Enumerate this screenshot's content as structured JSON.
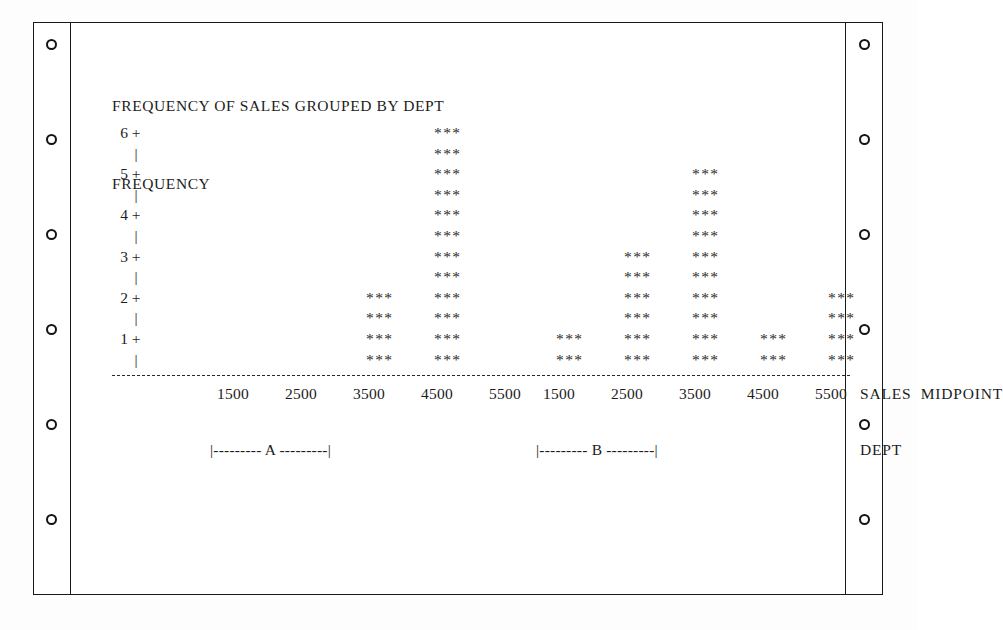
{
  "paper": {
    "type": "continuous-form-tractor-feed",
    "hole_count_per_side": 6
  },
  "report": {
    "title": "FREQUENCY OF SALES GROUPED BY DEPT",
    "subtitle": "FREQUENCY",
    "axis_caption": "SALES  MIDPOINT",
    "dept_caption": "DEPT",
    "bracket_a": "|--------- A ---------|",
    "bracket_b": "|--------- B ---------|",
    "y_ticks": [
      "6",
      "5",
      "4",
      "3",
      "2",
      "1"
    ],
    "tick_mark": "+",
    "stem_mark": "|",
    "star_glyph": "***"
  },
  "chart_data": {
    "type": "bar",
    "title": "FREQUENCY OF SALES GROUPED BY DEPT",
    "xlabel": "SALES  MIDPOINT",
    "ylabel": "FREQUENCY",
    "ylim": [
      0,
      6
    ],
    "yticks": [
      1,
      2,
      3,
      4,
      5,
      6
    ],
    "grid": false,
    "legend": "none",
    "group_label": "DEPT",
    "rows_per_unit": 2,
    "categories": [
      "1500",
      "2500",
      "3500",
      "4500",
      "5500"
    ],
    "series": [
      {
        "name": "A",
        "values": [
          0,
          0,
          2,
          6,
          0
        ]
      },
      {
        "name": "B",
        "values": [
          1,
          3,
          5,
          1,
          2
        ]
      }
    ]
  }
}
